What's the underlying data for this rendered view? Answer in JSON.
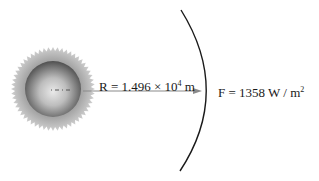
{
  "diagram": {
    "sun": {
      "label": "Sun",
      "center_x": 53,
      "center_y": 89,
      "radius": 28,
      "corona_radius": 42
    },
    "distance_label": {
      "prefix": "R = 1.496 × 10",
      "exponent": "4",
      "unit": " m"
    },
    "flux_label": {
      "prefix": "F = 1358 W / m",
      "exponent": "2"
    },
    "arrow": {
      "from_x": 83,
      "to_x": 200,
      "y": 91,
      "color": "#8a8a8a"
    },
    "sphere_arc": {
      "color": "#1a1a1a"
    }
  }
}
